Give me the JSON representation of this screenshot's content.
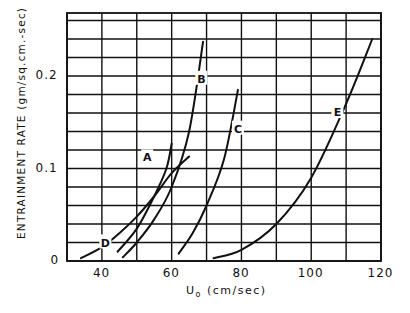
{
  "chart_data": {
    "type": "line",
    "title": "",
    "xlabel": "U0 (cm/sec)",
    "xlabel_main": "U",
    "xlabel_sub": "o",
    "xlabel_unit": "(cm/sec)",
    "ylabel": "ENTRAINMENT RATE (gm/sq.cm.-sec)",
    "xlim": [
      30,
      120
    ],
    "ylim": [
      0,
      0.265
    ],
    "grid": true,
    "x_gridlines": [
      30,
      40,
      50,
      60,
      70,
      80,
      90,
      100,
      110,
      120
    ],
    "y_gridlines": [
      0,
      0.02,
      0.04,
      0.06,
      0.08,
      0.1,
      0.12,
      0.14,
      0.16,
      0.18,
      0.2,
      0.22,
      0.24,
      0.26
    ],
    "x_ticks": [
      {
        "value": 40,
        "label": "40"
      },
      {
        "value": 60,
        "label": "60"
      },
      {
        "value": 80,
        "label": "80"
      },
      {
        "value": 100,
        "label": "100"
      },
      {
        "value": 120,
        "label": "120"
      }
    ],
    "y_ticks": [
      {
        "value": 0,
        "label": "0"
      },
      {
        "value": 0.1,
        "label": "0.1"
      },
      {
        "value": 0.2,
        "label": "0.2"
      }
    ],
    "legend": "none (curves labeled directly A–E)",
    "series": [
      {
        "name": "A",
        "x": [
          44.5,
          50,
          55,
          58.5,
          60
        ],
        "y": [
          0.01,
          0.035,
          0.07,
          0.1,
          0.127
        ],
        "label_at": [
          53,
          0.112
        ]
      },
      {
        "name": "B",
        "x": [
          46,
          50,
          55,
          60,
          65,
          69
        ],
        "y": [
          0.004,
          0.02,
          0.045,
          0.08,
          0.14,
          0.237
        ],
        "label_at": [
          68.5,
          0.197
        ]
      },
      {
        "name": "C",
        "x": [
          62,
          66,
          70,
          75,
          79
        ],
        "y": [
          0.008,
          0.03,
          0.06,
          0.11,
          0.185
        ],
        "label_at": [
          79,
          0.143
        ]
      },
      {
        "name": "D",
        "x": [
          34,
          40,
          45,
          50,
          55,
          60,
          65
        ],
        "y": [
          0.003,
          0.015,
          0.03,
          0.048,
          0.07,
          0.095,
          0.113
        ],
        "label_at": [
          41,
          0.02
        ]
      },
      {
        "name": "E",
        "x": [
          72,
          80,
          90,
          100,
          110,
          117.5
        ],
        "y": [
          0.003,
          0.012,
          0.04,
          0.09,
          0.17,
          0.24
        ],
        "label_at": [
          107.5,
          0.161
        ]
      }
    ]
  }
}
